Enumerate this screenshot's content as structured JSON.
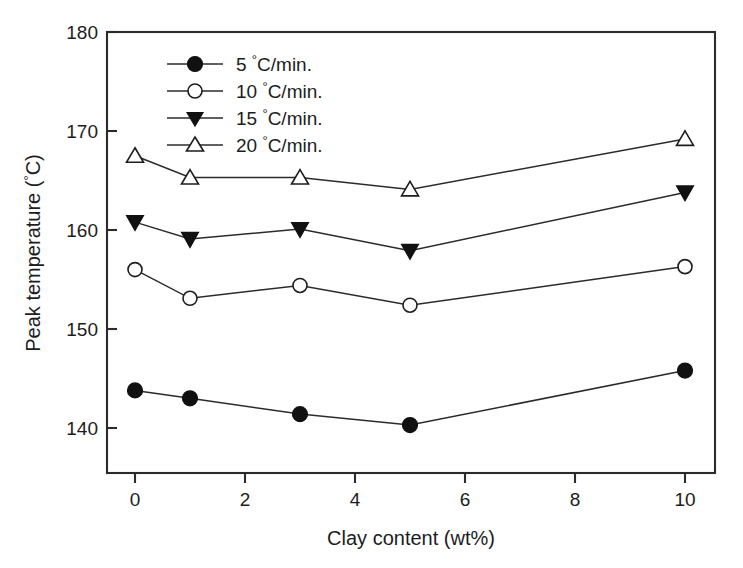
{
  "chart_data": {
    "type": "line",
    "title": "",
    "xlabel": "Clay content (wt%)",
    "ylabel": "Peak temperature (°C)",
    "xlim": [
      -0.5,
      11.2
    ],
    "ylim": [
      135.5,
      180
    ],
    "xticks": [
      "0",
      "2",
      "4",
      "6",
      "8",
      "10"
    ],
    "xtick_values": [
      0,
      2,
      4,
      6,
      8,
      10
    ],
    "yticks": [
      "140",
      "150",
      "160",
      "170",
      "180"
    ],
    "ytick_values": [
      140,
      150,
      160,
      170,
      180
    ],
    "grid": false,
    "legend_position": "upper-left-inside",
    "x": [
      0,
      1,
      3,
      5,
      10
    ],
    "series": [
      {
        "name": "5 °C/min.",
        "label_value": "5",
        "label_unit": "C/min.",
        "marker": "filled-circle",
        "color": "#111111",
        "values": [
          143.8,
          143.0,
          141.4,
          140.3,
          145.8
        ]
      },
      {
        "name": "10 °C/min.",
        "label_value": "10",
        "label_unit": "C/min.",
        "marker": "open-circle",
        "color": "#111111",
        "values": [
          156.0,
          153.1,
          154.4,
          152.4,
          156.3
        ]
      },
      {
        "name": "15 °C/min.",
        "label_value": "15",
        "label_unit": "C/min.",
        "marker": "filled-triangle-down",
        "color": "#111111",
        "values": [
          160.8,
          159.1,
          160.1,
          157.9,
          163.8
        ]
      },
      {
        "name": "20 °C/min.",
        "label_value": "20",
        "label_unit": "C/min.",
        "marker": "open-triangle-up",
        "color": "#111111",
        "values": [
          167.5,
          165.3,
          165.3,
          164.1,
          169.2
        ]
      }
    ]
  },
  "axes": {
    "x_title": "Clay content (wt%)",
    "y_title_main": "Peak temperature (",
    "y_title_deg": "°",
    "y_title_tail": "C)"
  },
  "legend": {
    "entries": [
      {
        "value": "5",
        "deg": "°",
        "unit": "C/min."
      },
      {
        "value": "10",
        "deg": "°",
        "unit": "C/min."
      },
      {
        "value": "15",
        "deg": "°",
        "unit": "C/min."
      },
      {
        "value": "20",
        "deg": "°",
        "unit": "C/min."
      }
    ]
  },
  "colors": {
    "axis": "#2b2b2b",
    "ink": "#111111",
    "background": "#ffffff"
  }
}
